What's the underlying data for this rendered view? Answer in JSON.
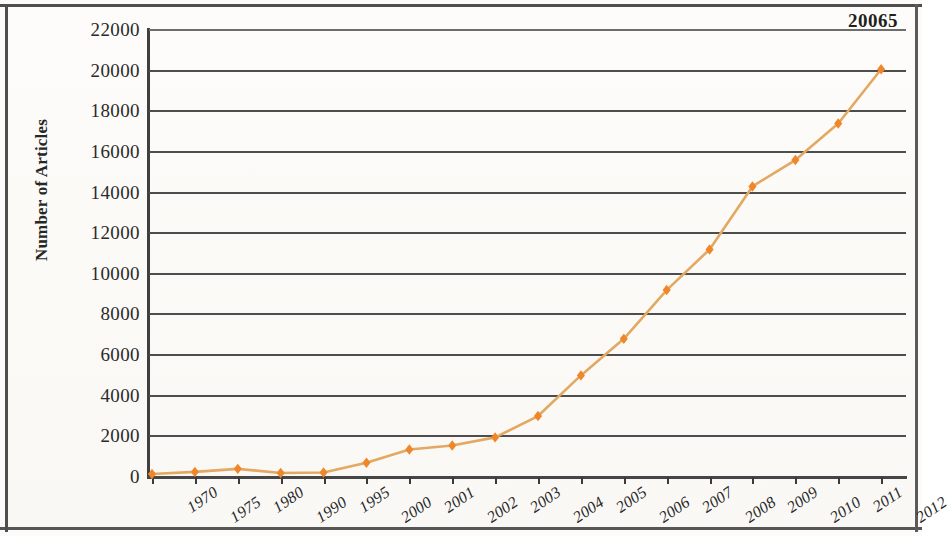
{
  "chart_data": {
    "type": "line",
    "title": "",
    "xlabel": "",
    "ylabel": "Number of Articles",
    "categories": [
      "1970",
      "1975",
      "1980",
      "1990",
      "1995",
      "2000",
      "2001",
      "2002",
      "2003",
      "2004",
      "2005",
      "2006",
      "2007",
      "2008",
      "2009",
      "2010",
      "2011",
      "2012"
    ],
    "values": [
      150,
      250,
      400,
      200,
      220,
      700,
      1350,
      1550,
      1950,
      3000,
      5000,
      6800,
      9200,
      11200,
      14300,
      15600,
      17400,
      20065
    ],
    "series": [
      {
        "name": "Number of Articles",
        "values": [
          150,
          250,
          400,
          200,
          220,
          700,
          1350,
          1550,
          1950,
          3000,
          5000,
          6800,
          9200,
          11200,
          14300,
          15600,
          17400,
          20065
        ]
      }
    ],
    "ylim": [
      0,
      22000
    ],
    "y_ticks": [
      0,
      2000,
      4000,
      6000,
      8000,
      10000,
      12000,
      14000,
      16000,
      18000,
      20000,
      22000
    ],
    "y_tick_labels": [
      "0",
      "2000",
      "4000",
      "6000",
      "8000",
      "10000",
      "12000",
      "14000",
      "16000",
      "18000",
      "20000",
      "22000"
    ],
    "grid": true,
    "grid_axis": "y",
    "legend": false,
    "legend_position": "none",
    "marker": "diamond",
    "marker_color": "#f0862a",
    "line_color": "#e3a861",
    "gridline_color": "#4d4d4d",
    "axis_color": "#3f3f3f",
    "background_color": "#fcfbf9",
    "annotations": [
      {
        "text": "20065",
        "category": "2012",
        "value": 20065,
        "position": "above-right"
      }
    ]
  },
  "axis": {
    "y_title": "Number of Articles"
  },
  "labels": {
    "end_value": "20065"
  }
}
